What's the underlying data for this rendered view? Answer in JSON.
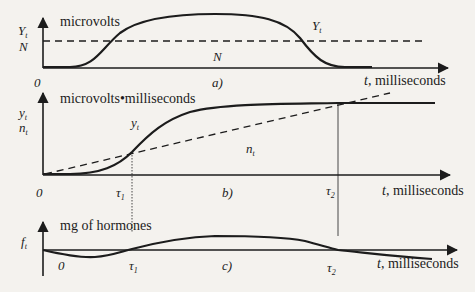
{
  "panels": [
    {
      "id": "a",
      "caption": "a)",
      "y_unit": "microvolts",
      "y_labels": [
        "Y",
        "N"
      ],
      "y_label_sub": "t",
      "curve_label": "Y",
      "curve_label_sub": "t",
      "threshold_label": "N",
      "origin": "0",
      "x_label": "t, milliseconds"
    },
    {
      "id": "b",
      "caption": "b)",
      "y_unit": "microvolts•milliseconds",
      "y_labels": [
        "y",
        "n"
      ],
      "y_label_sub": "t",
      "curve_label": "y",
      "curve_label_sub": "t",
      "line_label": "n",
      "line_label_sub": "t",
      "origin": "0",
      "tau1": "τ",
      "tau1_sub": "1",
      "tau2": "τ",
      "tau2_sub": "2",
      "x_label": "t, milliseconds"
    },
    {
      "id": "c",
      "caption": "c)",
      "y_unit": "mg of hormones",
      "y_label": "f",
      "y_label_sub": "t",
      "origin": "0",
      "tau1": "τ",
      "tau1_sub": "1",
      "tau2": "τ",
      "tau2_sub": "2",
      "x_label": "t, milliseconds"
    }
  ]
}
